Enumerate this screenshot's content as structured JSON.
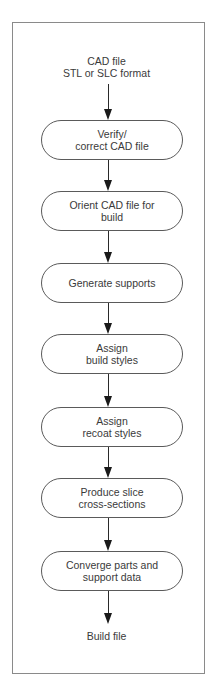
{
  "diagram": {
    "type": "flowchart",
    "start": {
      "line1": "CAD file",
      "line2": "STL or SLC format"
    },
    "steps": [
      {
        "label": "Verify/\ncorrect CAD file"
      },
      {
        "label": "Orient CAD file for\nbuild"
      },
      {
        "label": "Generate supports"
      },
      {
        "label": "Assign\nbuild styles"
      },
      {
        "label": "Assign\nrecoat styles"
      },
      {
        "label": "Produce slice\ncross-sections"
      },
      {
        "label": "Converge parts and\nsupport data"
      }
    ],
    "end": {
      "label": "Build file"
    },
    "colors": {
      "line": "#2a2a2a",
      "border": "#5a5a5a",
      "frame": "#8a8a8a",
      "text": "#3a3a3a",
      "background": "#ffffff"
    }
  }
}
